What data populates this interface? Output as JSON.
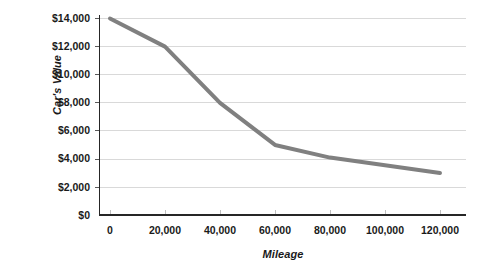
{
  "chart_data": {
    "type": "line",
    "title": "",
    "subtitle": "",
    "xlabel": "Mileage",
    "ylabel": "Car's Value",
    "x": [
      0,
      20000,
      40000,
      60000,
      80000,
      120000
    ],
    "values": [
      14000,
      12000,
      8000,
      5000,
      4100,
      3000
    ],
    "series": [
      {
        "name": "Car's Value",
        "values": [
          14000,
          12000,
          8000,
          5000,
          4100,
          3000
        ],
        "color": "#808080"
      }
    ],
    "xlim": [
      0,
      130000
    ],
    "ylim": [
      0,
      14000
    ],
    "xticks": [
      0,
      20000,
      40000,
      60000,
      80000,
      100000,
      120000
    ],
    "yticks": [
      0,
      2000,
      4000,
      6000,
      8000,
      10000,
      12000,
      14000
    ],
    "xticklabels": [
      "0",
      "20,000",
      "40,000",
      "60,000",
      "80,000",
      "100,000",
      "120,000"
    ],
    "yticklabels": [
      "$0",
      "$2,000",
      "$4,000",
      "$6,000",
      "$8,000",
      "$10,000",
      "$12,000",
      "$14,000"
    ],
    "grid": "horizontal",
    "legend": "none",
    "annotations": []
  },
  "axes": {
    "y_title": "Car's Value",
    "x_title": "Mileage",
    "y_labels": [
      "$14,000",
      "$12,000",
      "$10,000",
      "$8,000",
      "$6,000",
      "$4,000",
      "$2,000",
      "$0"
    ],
    "x_labels": [
      "0",
      "20,000",
      "40,000",
      "60,000",
      "80,000",
      "100,000",
      "120,000"
    ]
  },
  "caption": {
    "text": ""
  },
  "colors": {
    "line": "#808080",
    "gridline": "#d9d9d9",
    "axis": "#262626",
    "text": "#1a1a1a",
    "background": "#ffffff"
  }
}
